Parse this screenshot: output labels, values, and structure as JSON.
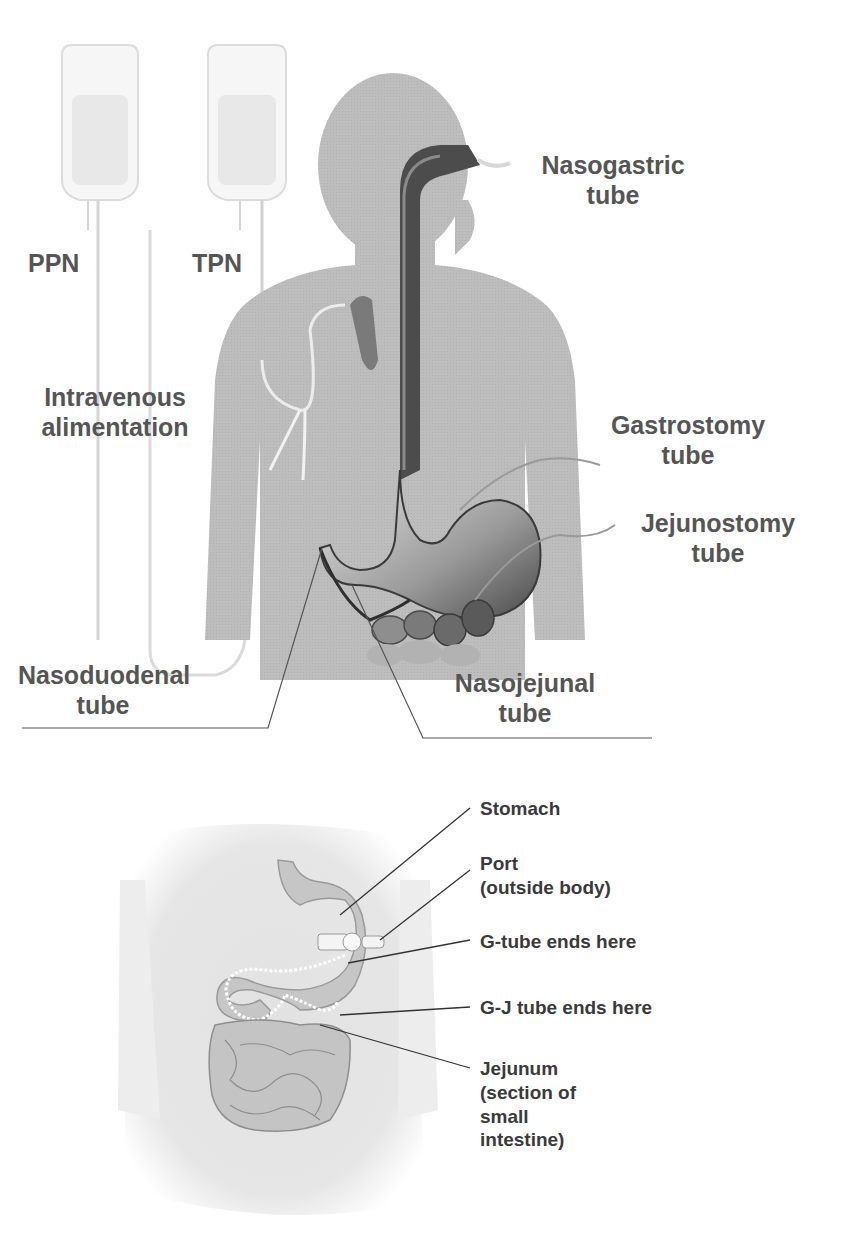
{
  "figure_top": {
    "description": "Enteral and parenteral nutrition routes",
    "labels": {
      "ppn": "PPN",
      "tpn": "TPN",
      "nasogastric": [
        "Nasogastric",
        "tube"
      ],
      "intravenous": [
        "Intravenous",
        "alimentation"
      ],
      "gastrostomy": [
        "Gastrostomy",
        "tube"
      ],
      "jejunostomy": [
        "Jejunostomy",
        "tube"
      ],
      "nasoduodenal": [
        "Nasoduodenal",
        "tube"
      ],
      "nasojejunal": [
        "Nasojejunal",
        "tube"
      ]
    }
  },
  "figure_bottom": {
    "description": "G-J tube placement",
    "labels": {
      "stomach": [
        "Stomach"
      ],
      "port": [
        "Port",
        "(outside body)"
      ],
      "g_tube": [
        "G-tube ends here"
      ],
      "gj_tube": [
        "G-J tube ends here"
      ],
      "jejunum": [
        "Jejunum",
        "(section of",
        "small",
        "intestine)"
      ]
    }
  },
  "colors": {
    "body_fill": "#bdbdbd",
    "tube_dark": "#3a3a3a",
    "label_text": "#555555",
    "bottom_label_text": "#3a3a3a",
    "background": "#ffffff"
  }
}
